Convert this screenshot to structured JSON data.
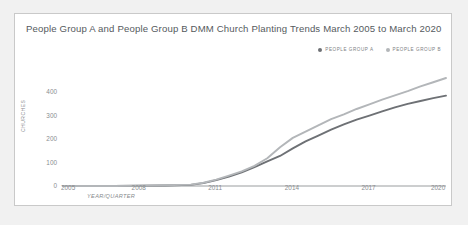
{
  "chart_data": {
    "type": "line",
    "title": "People Group A and People Group B DMM Church Planting Trends March 2005 to March 2020",
    "xlabel": "YEAR/QUARTER",
    "ylabel": "CHURCHES",
    "xlim": [
      2005,
      2020
    ],
    "ylim": [
      0,
      460
    ],
    "yticks": [
      "0",
      "100",
      "200",
      "300",
      "400"
    ],
    "ytick_values": [
      0,
      100,
      200,
      300,
      400
    ],
    "xticks": [
      "2005",
      "2008",
      "2011",
      "2014",
      "2017",
      "2020"
    ],
    "xtick_values": [
      2005,
      2008,
      2011,
      2014,
      2017,
      2020
    ],
    "grid": false,
    "legend_position": "top-right",
    "x": [
      2005,
      2006,
      2007,
      2008,
      2009,
      2010,
      2010.5,
      2011,
      2011.5,
      2012,
      2012.5,
      2013,
      2013.5,
      2014,
      2014.5,
      2015,
      2015.5,
      2016,
      2016.5,
      2017,
      2017.5,
      2018,
      2018.5,
      2019,
      2019.5,
      2020
    ],
    "series": [
      {
        "name": "PEOPLE GROUP A",
        "color": "#6e7175",
        "values": [
          0,
          0,
          0,
          1,
          2,
          5,
          12,
          25,
          40,
          58,
          80,
          105,
          128,
          160,
          190,
          215,
          240,
          262,
          283,
          300,
          318,
          335,
          350,
          362,
          374,
          385
        ]
      },
      {
        "name": "PEOPLE GROUP B",
        "color": "#b3b6b9",
        "values": [
          0,
          0,
          0,
          1,
          3,
          6,
          14,
          27,
          44,
          62,
          86,
          118,
          165,
          205,
          232,
          258,
          285,
          305,
          328,
          348,
          368,
          386,
          404,
          424,
          442,
          460
        ]
      }
    ]
  },
  "legend": {
    "items": [
      {
        "label": "PEOPLE GROUP A",
        "color": "#6e7175"
      },
      {
        "label": "PEOPLE GROUP B",
        "color": "#b3b6b9"
      }
    ]
  }
}
